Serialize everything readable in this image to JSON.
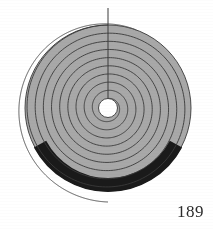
{
  "page": {
    "number_label": "189",
    "background_color": "#ffffff"
  },
  "figure": {
    "name": "archimedean-spiral-diagram",
    "center": {
      "x": 108,
      "y": 108
    },
    "colors": {
      "fill_gray": "#a8a8a8",
      "stroke_dark": "#3a3a3a",
      "highlight_black": "#1a1a1a",
      "paper_white": "#ffffff"
    },
    "core_hole": {
      "radius": 9.5,
      "fill": "#ffffff"
    },
    "disk": {
      "outer_radius": 83,
      "fill": "#a8a8a8"
    },
    "outline_arc": {
      "label": "outermost-spiral-turn-unfilled",
      "start_radius": 94,
      "end_radius": 83,
      "start_angle_deg": -90,
      "end_angle_deg": 108,
      "stroke": "#555555",
      "stroke_width": 1
    },
    "black_band": {
      "label": "highlighted-outer-sector",
      "inner_radius": 70,
      "outer_radius": 84,
      "start_angle_deg": 28,
      "end_angle_deg": 152,
      "fill": "#1a1a1a"
    },
    "radius_line": {
      "label": "vertical-radius-from-center-to-spiral-start",
      "from": {
        "x": 108,
        "y": 108
      },
      "to": {
        "x": 108,
        "y": 8
      },
      "stroke": "#3a3a3a",
      "stroke_width": 1
    },
    "spiral": {
      "type": "archimedean",
      "turns": 9,
      "start_radius": 9.5,
      "end_radius": 83,
      "stroke": "#3a3a3a",
      "stroke_width": 0.9,
      "turn_radii": [
        9.5,
        18,
        26.5,
        35,
        43.5,
        52,
        60.5,
        69,
        75,
        83
      ]
    }
  },
  "chart_data": {
    "type": "line",
    "title": "",
    "xlabel": "",
    "ylabel": "",
    "series": [
      {
        "name": "spiral-turn-radii",
        "categories": [
          "t1",
          "t2",
          "t3",
          "t4",
          "t5",
          "t6",
          "t7",
          "t8",
          "t9",
          "t10"
        ],
        "values": [
          9.5,
          18,
          26.5,
          35,
          43.5,
          52,
          60.5,
          69,
          75,
          83
        ]
      }
    ]
  }
}
